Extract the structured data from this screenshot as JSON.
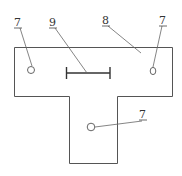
{
  "diagram": {
    "type": "technical-drawing",
    "shape": "T-shaped plate",
    "labels": [
      {
        "id": "label-7-left",
        "text": "7",
        "refers_to": "left hole"
      },
      {
        "id": "label-9",
        "text": "9",
        "refers_to": "horizontal dimension mark"
      },
      {
        "id": "label-8",
        "text": "8",
        "refers_to": "plate body"
      },
      {
        "id": "label-7-right",
        "text": "7",
        "refers_to": "right hole"
      },
      {
        "id": "label-7-bottom",
        "text": "7",
        "refers_to": "bottom hole"
      }
    ],
    "holes": [
      "left",
      "right",
      "bottom"
    ],
    "colors": {
      "line": "#555555",
      "background": "#ffffff"
    }
  }
}
